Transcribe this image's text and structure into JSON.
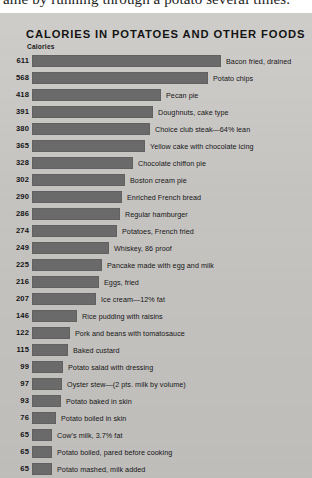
{
  "page_text_above": "ame by running through a potato several times.",
  "chart_data": {
    "type": "bar",
    "orientation": "horizontal",
    "title": "CALORIES IN POTATOES AND OTHER FOODS",
    "subtitle": "",
    "xlabel": "Calories",
    "ylabel": "",
    "xlim": [
      0,
      611
    ],
    "grid": false,
    "legend": null,
    "footnote": "Calorie value of all the above items are for 3½ ounces of edible portions",
    "categories": [
      "Bacon fried, drained",
      "Potato chips",
      "Pecan pie",
      "Doughnuts, cake type",
      "Choice club steak—64% lean",
      "Yellow cake with chocolate icing",
      "Chocolate chiffon pie",
      "Boston cream pie",
      "Enriched French bread",
      "Regular hamburger",
      "Potatoes, French fried",
      "Whiskey, 86 proof",
      "Pancake made with egg and  milk",
      "Eggs, fried",
      "Ice cream—12% fat",
      "Rice pudding with raisins",
      "Pork and beans with tomatosauce",
      "Baked custard",
      "Potato salad with dressing",
      "Oyster stew—(2 pts. milk by volume)",
      "Potato baked in skin",
      "Potato boiled in skin",
      "Cow's milk, 3.7% fat",
      "Potato boiled, pared before  cooking",
      "Potato mashed, milk added"
    ],
    "values": [
      611,
      568,
      418,
      391,
      380,
      365,
      328,
      302,
      290,
      286,
      274,
      249,
      225,
      216,
      207,
      146,
      122,
      115,
      99,
      97,
      93,
      76,
      65,
      65,
      65
    ]
  },
  "colors": {
    "bar": "#6a6a6a",
    "panel_background": "#cac8c5",
    "text": "#141414",
    "page_background": "#ffffff"
  }
}
